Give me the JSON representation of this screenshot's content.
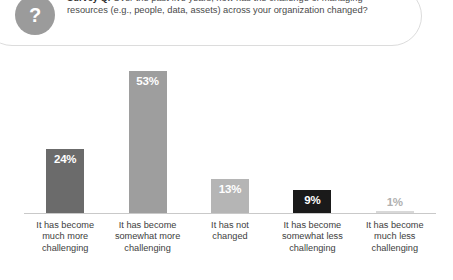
{
  "survey_card": {
    "badge_icon": "question-mark-icon",
    "badge_glyph": "?",
    "lead_label": "Survey Q.",
    "question": " Over the past five years, how has the challenge of managing resources (e.g., people, data, assets) across your organization changed?"
  },
  "chart_data": {
    "type": "bar",
    "title": "",
    "xlabel": "",
    "ylabel": "",
    "ylim": [
      0,
      60
    ],
    "grid": false,
    "legend": "none",
    "categories": [
      "It has become much more challenging",
      "It has become somewhat more challenging",
      "It has not changed",
      "It has become somewhat less challenging",
      "It has become much less challenging"
    ],
    "category_lines": [
      [
        "It has become",
        "much more",
        "challenging"
      ],
      [
        "It has become",
        "somewhat more",
        "challenging"
      ],
      [
        "It has not",
        "changed",
        ""
      ],
      [
        "It has become",
        "somewhat less",
        "challenging"
      ],
      [
        "It has become",
        "much less",
        "challenging"
      ]
    ],
    "values": [
      24,
      53,
      13,
      9,
      1
    ],
    "value_labels": [
      "24%",
      "53%",
      "13%",
      "9%",
      "1%"
    ],
    "bar_colors": [
      "#6b6b6b",
      "#9e9e9e",
      "#b5b5b5",
      "#1a1a1a",
      "#d8d8d8"
    ],
    "label_colors": [
      "#ffffff",
      "#ffffff",
      "#ffffff",
      "#ffffff",
      "#b0b0b0"
    ],
    "label_inside": [
      true,
      true,
      true,
      true,
      false
    ]
  },
  "colors": {
    "badge": "#9b9b9b",
    "card_border": "#dcdcdc",
    "baseline": "#c9c9c9",
    "text": "#3d3d3d"
  }
}
